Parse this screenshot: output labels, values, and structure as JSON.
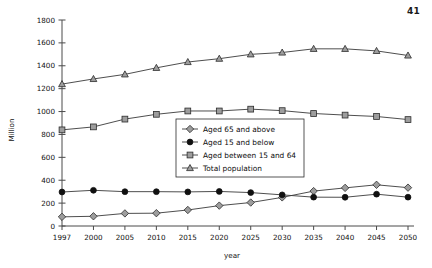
{
  "page": {
    "number": "41"
  },
  "chart_data": {
    "type": "line",
    "title": "",
    "xlabel": "year",
    "ylabel": "Million",
    "categories": [
      "1997",
      "2000",
      "2005",
      "2010",
      "2015",
      "2020",
      "2025",
      "2030",
      "2035",
      "2040",
      "2045",
      "2050"
    ],
    "ylim": [
      0,
      1800
    ],
    "ytick_step": 200,
    "yticks": [
      "0",
      "200",
      "400",
      "600",
      "800",
      "1000",
      "1200",
      "1400",
      "1600",
      "1800"
    ],
    "grid": false,
    "legend_position": "center",
    "series": [
      {
        "name": "Aged 65 and above",
        "marker": "diamond",
        "marker_fill": "#9d9d9d",
        "values": [
          80,
          85,
          110,
          112,
          140,
          178,
          205,
          250,
          305,
          333,
          360,
          335
        ]
      },
      {
        "name": "Aged 15 and below",
        "marker": "circle",
        "marker_fill": "#101010",
        "values": [
          297,
          312,
          300,
          300,
          298,
          302,
          292,
          272,
          252,
          251,
          278,
          252
        ]
      },
      {
        "name": "Aged between 15 and 64",
        "marker": "square",
        "marker_fill": "#9d9d9d",
        "values": [
          840,
          866,
          934,
          976,
          1005,
          1005,
          1021,
          1008,
          983,
          969,
          957,
          930
        ]
      },
      {
        "name": "Total population",
        "marker": "triangle",
        "marker_fill": "#9d9d9d",
        "values": [
          1240,
          1285,
          1325,
          1382,
          1433,
          1462,
          1500,
          1516,
          1548,
          1548,
          1530,
          1490
        ]
      }
    ]
  }
}
